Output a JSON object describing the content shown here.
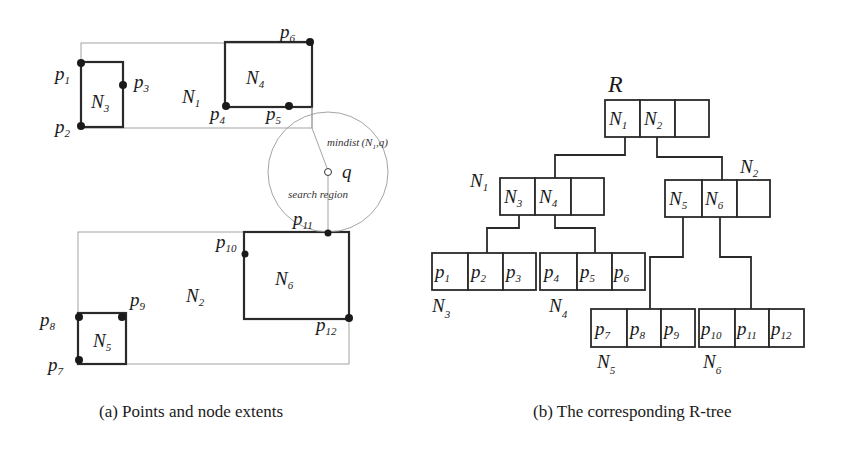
{
  "figure_a": {
    "caption": "(a) Points and node extents",
    "node_labels": {
      "N1": {
        "base": "N",
        "sub": "1"
      },
      "N2": {
        "base": "N",
        "sub": "2"
      },
      "N3": {
        "base": "N",
        "sub": "3"
      },
      "N4": {
        "base": "N",
        "sub": "4"
      },
      "N5": {
        "base": "N",
        "sub": "5"
      },
      "N6": {
        "base": "N",
        "sub": "6"
      }
    },
    "points": [
      {
        "base": "p",
        "sub": "1"
      },
      {
        "base": "p",
        "sub": "2"
      },
      {
        "base": "p",
        "sub": "3"
      },
      {
        "base": "p",
        "sub": "4"
      },
      {
        "base": "p",
        "sub": "5"
      },
      {
        "base": "p",
        "sub": "6"
      },
      {
        "base": "p",
        "sub": "7"
      },
      {
        "base": "p",
        "sub": "8"
      },
      {
        "base": "p",
        "sub": "9"
      },
      {
        "base": "p",
        "sub": "10"
      },
      {
        "base": "p",
        "sub": "11"
      },
      {
        "base": "p",
        "sub": "12"
      }
    ],
    "query_label": "q",
    "mindist_label": "mindist",
    "mindist_args_open": "(N",
    "mindist_args_sub": "1",
    "mindist_args_close": ",q)",
    "search_region_label": "search region"
  },
  "figure_b": {
    "caption": "(b) The corresponding R-tree",
    "root_label": "R",
    "root": {
      "entries": [
        {
          "base": "N",
          "sub": "1"
        },
        {
          "base": "N",
          "sub": "2"
        },
        {
          "base": "",
          "sub": ""
        }
      ]
    },
    "internal_nodes": [
      {
        "label": {
          "base": "N",
          "sub": "1"
        },
        "entries": [
          {
            "base": "N",
            "sub": "3"
          },
          {
            "base": "N",
            "sub": "4"
          },
          {
            "base": "",
            "sub": ""
          }
        ]
      },
      {
        "label": {
          "base": "N",
          "sub": "2"
        },
        "entries": [
          {
            "base": "N",
            "sub": "5"
          },
          {
            "base": "N",
            "sub": "6"
          },
          {
            "base": "",
            "sub": ""
          }
        ]
      }
    ],
    "leaf_nodes": [
      {
        "label": {
          "base": "N",
          "sub": "3"
        },
        "entries": [
          {
            "base": "p",
            "sub": "1"
          },
          {
            "base": "p",
            "sub": "2"
          },
          {
            "base": "p",
            "sub": "3"
          }
        ]
      },
      {
        "label": {
          "base": "N",
          "sub": "4"
        },
        "entries": [
          {
            "base": "p",
            "sub": "4"
          },
          {
            "base": "p",
            "sub": "5"
          },
          {
            "base": "p",
            "sub": "6"
          }
        ]
      },
      {
        "label": {
          "base": "N",
          "sub": "5"
        },
        "entries": [
          {
            "base": "p",
            "sub": "7"
          },
          {
            "base": "p",
            "sub": "8"
          },
          {
            "base": "p",
            "sub": "9"
          }
        ]
      },
      {
        "label": {
          "base": "N",
          "sub": "6"
        },
        "entries": [
          {
            "base": "p",
            "sub": "10"
          },
          {
            "base": "p",
            "sub": "11"
          },
          {
            "base": "p",
            "sub": "12"
          }
        ]
      }
    ]
  },
  "colors": {
    "ink": "#1a1a1a",
    "extent_line": "#9a9a9a",
    "background": "#ffffff"
  }
}
